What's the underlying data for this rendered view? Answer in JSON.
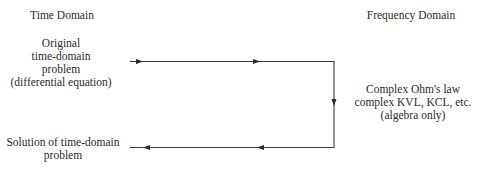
{
  "headers": {
    "time_domain": "Time Domain",
    "frequency_domain": "Frequency Domain"
  },
  "boxes": {
    "original_problem": {
      "lines": [
        "Original",
        "time-domain",
        "problem",
        "(differential equation)"
      ]
    },
    "frequency_methods": {
      "lines": [
        "Complex Ohm's law",
        "complex KVL, KCL, etc.",
        "(algebra only)"
      ]
    },
    "solution": {
      "lines": [
        "Solution of time-domain",
        "problem"
      ]
    }
  },
  "colors": {
    "line": "#3a3a3a",
    "text": "#2b2b2b",
    "background": "#ffffff"
  }
}
